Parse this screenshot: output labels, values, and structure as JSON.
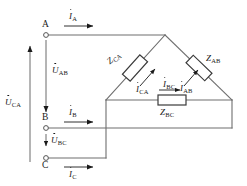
{
  "diagram": {
    "type": "schematic",
    "stroke_color": "#666666",
    "text_color": "#1a1a1a",
    "terminals": [
      {
        "id": "A",
        "label": "A",
        "x": 46,
        "y": 35
      },
      {
        "id": "B",
        "label": "B",
        "x": 46,
        "y": 128
      },
      {
        "id": "C",
        "label": "C",
        "x": 46,
        "y": 158
      }
    ],
    "line_currents": [
      {
        "id": "IA",
        "symbol": "I",
        "subscript": "A",
        "arrow_direction": "right"
      },
      {
        "id": "IB",
        "symbol": "I",
        "subscript": "B",
        "arrow_direction": "right"
      },
      {
        "id": "IC",
        "symbol": "I",
        "subscript": "C",
        "arrow_direction": "right"
      }
    ],
    "line_voltages": [
      {
        "id": "UAB",
        "symbol": "U",
        "subscript": "AB",
        "arrow_direction": "down"
      },
      {
        "id": "UBC",
        "symbol": "U",
        "subscript": "BC",
        "arrow_direction": "down"
      },
      {
        "id": "UCA",
        "symbol": "U",
        "subscript": "CA",
        "arrow_direction": "up"
      }
    ],
    "impedances": [
      {
        "id": "ZCA",
        "symbol": "Z",
        "subscript": "CA",
        "branch": "left-diagonal"
      },
      {
        "id": "ZAB",
        "symbol": "Z",
        "subscript": "AB",
        "branch": "right-diagonal"
      },
      {
        "id": "ZBC",
        "symbol": "Z",
        "subscript": "BC",
        "branch": "bottom-horizontal"
      }
    ],
    "phase_currents": [
      {
        "id": "ICA",
        "symbol": "I",
        "subscript": "CA",
        "arrow_direction": "up-right"
      },
      {
        "id": "IAB",
        "symbol": "I",
        "subscript": "AB",
        "arrow_direction": "up-right"
      },
      {
        "id": "IBC",
        "symbol": "I",
        "subscript": "BC",
        "arrow_direction": "right"
      }
    ]
  }
}
